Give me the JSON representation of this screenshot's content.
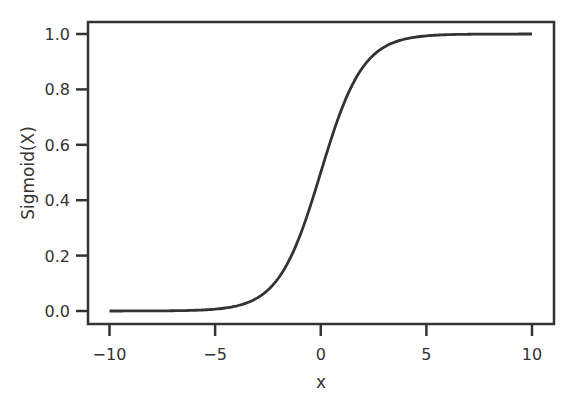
{
  "chart_data": {
    "type": "line",
    "title": "",
    "xlabel": "x",
    "ylabel": "Sigmoid(X)",
    "xlim": [
      -11,
      11
    ],
    "ylim": [
      -0.05,
      1.05
    ],
    "grid": false,
    "legend": null,
    "x_ticks": [
      -10,
      -5,
      0,
      5,
      10
    ],
    "x_tick_labels": [
      "−10",
      "−5",
      "0",
      "5",
      "10"
    ],
    "y_ticks": [
      0.0,
      0.2,
      0.4,
      0.6,
      0.8,
      1.0
    ],
    "y_tick_labels": [
      "0.0",
      "0.2",
      "0.4",
      "0.6",
      "0.8",
      "1.0"
    ],
    "series": [
      {
        "name": "sigmoid",
        "function": "1/(1+exp(-x))",
        "color": "#333333",
        "x": [
          -10,
          -8,
          -6,
          -5,
          -4,
          -3,
          -2,
          -1,
          0,
          1,
          2,
          3,
          4,
          5,
          6,
          8,
          10
        ],
        "y": [
          0.0,
          0.0003,
          0.0025,
          0.0067,
          0.018,
          0.047,
          0.119,
          0.269,
          0.5,
          0.731,
          0.881,
          0.953,
          0.982,
          0.993,
          0.998,
          0.9997,
          1.0
        ]
      }
    ]
  }
}
